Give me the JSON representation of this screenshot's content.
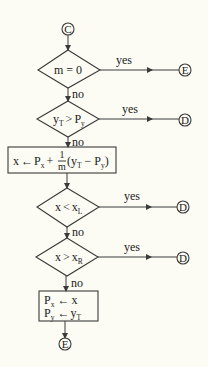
{
  "colors": {
    "background": "#fcfcf4",
    "stroke": "#3a3a3a",
    "text": "#222222"
  },
  "start_connector": {
    "label": "C"
  },
  "decisions": [
    {
      "id": "d1",
      "text": "m = 0",
      "yes_label": "yes",
      "yes_target": "E",
      "no_label": "no"
    },
    {
      "id": "d2",
      "text_main": "y",
      "text_sub": "T",
      "op": ">",
      "rhs_main": "P",
      "rhs_sub": "y",
      "yes_label": "yes",
      "yes_target": "D",
      "no_label": "no"
    },
    {
      "id": "d3",
      "text_main": "x",
      "op": "<",
      "rhs_main": "x",
      "rhs_sub": "L",
      "yes_label": "yes",
      "yes_target": "D",
      "no_label": "no"
    },
    {
      "id": "d4",
      "text_main": "x",
      "op": ">",
      "rhs_main": "x",
      "rhs_sub": "R",
      "yes_label": "yes",
      "yes_target": "D",
      "no_label": "no"
    }
  ],
  "process_1": {
    "lhs": "x",
    "arrow": "←",
    "p": "P",
    "p_sub": "x",
    "plus": "+",
    "frac_num": "1",
    "frac_den": "m",
    "paren_open": "(y",
    "y_sub": "T",
    "minus": " − P",
    "py_sub": "y",
    "paren_close": ")"
  },
  "process_2": {
    "line1": {
      "lhs": "P",
      "lhs_sub": "x",
      "arrow": "←",
      "rhs": "x"
    },
    "line2": {
      "lhs": "P",
      "lhs_sub": "y",
      "arrow": "←",
      "rhs": "y",
      "rhs_sub": "T"
    }
  },
  "end_connector": {
    "label": "E"
  }
}
